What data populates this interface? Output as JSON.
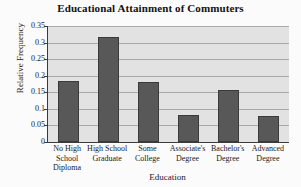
{
  "chart_data": {
    "type": "bar",
    "title": "Educational Attainment of Commuters",
    "xlabel": "Education",
    "ylabel": "Relative Frequency",
    "categories": [
      "No High School Diploma",
      "High School Graduate",
      "Some College",
      "Associate's Degree",
      "Bachelor's Degree",
      "Advanced Degree"
    ],
    "category_lines": [
      [
        "No High",
        "School",
        "Diploma"
      ],
      [
        "High School",
        "Graduate"
      ],
      [
        "Some",
        "College"
      ],
      [
        "Associate's",
        "Degree"
      ],
      [
        "Bachelor's",
        "Degree"
      ],
      [
        "Advanced",
        "Degree"
      ]
    ],
    "values": [
      0.185,
      0.318,
      0.181,
      0.082,
      0.158,
      0.078
    ],
    "ylim": [
      0,
      0.35
    ],
    "yticks": [
      0,
      0.05,
      0.1,
      0.15,
      0.2,
      0.25,
      0.3,
      0.35
    ],
    "ytick_labels": [
      "0",
      "0.05",
      "0.1",
      "0.15",
      "0.2",
      "0.25",
      "0.3",
      "0.35"
    ],
    "grid": true,
    "grid_axis": "y",
    "legend": false,
    "bar_color": "#585858",
    "bar_edge_color": "#3a3a3a",
    "plot_background": "#e2e2e2",
    "gridline_color": "#a9a9a9",
    "axis_color": "#3b3b3b",
    "figure_background": "#fbfbfb"
  }
}
